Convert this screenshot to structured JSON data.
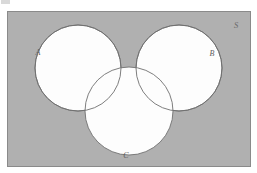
{
  "diagram": {
    "type": "venn-diagram",
    "universe": {
      "label": "S",
      "name": "universal-set-rectangle",
      "fill_color": "#b0b0b0",
      "border_color": "#8a8a8a",
      "x": 7,
      "y": 11,
      "width": 243,
      "height": 155
    },
    "sets": [
      {
        "id": "A",
        "label": "A",
        "name": "set-circle-a",
        "cx": 78,
        "cy": 68,
        "r": 43,
        "fill_color": "#fdfdfd",
        "stroke_color": "#6f6f6f",
        "label_x": 38,
        "label_y": 55
      },
      {
        "id": "B",
        "label": "B",
        "name": "set-circle-b",
        "cx": 179,
        "cy": 68,
        "r": 43,
        "fill_color": "#fdfdfd",
        "stroke_color": "#6f6f6f",
        "label_x": 212,
        "label_y": 56
      },
      {
        "id": "C",
        "label": "C",
        "name": "set-circle-c",
        "cx": 129,
        "cy": 111,
        "r": 44,
        "fill_color": "#fdfdfd",
        "stroke_color": "#6f6f6f",
        "label_x": 126,
        "label_y": 158
      }
    ],
    "universe_label_x": 236,
    "universe_label_y": 28,
    "relations": {
      "a_b_overlap": "none",
      "a_c_overlap": "partial",
      "b_c_overlap": "partial"
    }
  }
}
